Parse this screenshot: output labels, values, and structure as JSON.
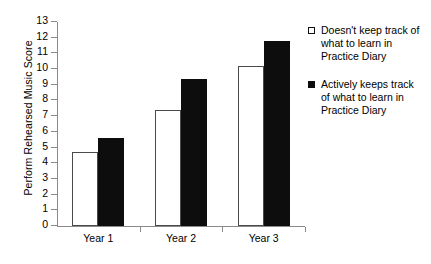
{
  "chart_data": {
    "type": "bar",
    "title": "",
    "xlabel": "",
    "ylabel": "Perform Rehearsed Music Score",
    "categories": [
      "Year 1",
      "Year 2",
      "Year 3"
    ],
    "ylim": [
      0,
      13
    ],
    "yticks": [
      0,
      1,
      2,
      3,
      4,
      5,
      6,
      7,
      8,
      9,
      10,
      11,
      12,
      13
    ],
    "ytick_labels": [
      "0",
      "1",
      "2",
      "3",
      "4",
      "5",
      "6",
      "7",
      "8",
      "9",
      "10",
      "11",
      "12",
      "13"
    ],
    "grid": false,
    "legend_position": "right",
    "series": [
      {
        "name": "Doesn't keep track of what to learn in Practice Diary",
        "style": "open",
        "fill": "#ffffff",
        "edge": "#4a4a4a",
        "values": [
          4.7,
          7.4,
          10.2
        ]
      },
      {
        "name": "Actively keeps track of what to learn in Practice Diary",
        "style": "filled",
        "fill": "#0d0d0d",
        "edge": "#0d0d0d",
        "values": [
          5.6,
          9.4,
          11.8
        ]
      }
    ]
  },
  "legend": {
    "items": [
      {
        "label": "Doesn't keep track of what to learn in Practice Diary",
        "swatch": "open-square-marker"
      },
      {
        "label": "Actively keeps track of what to learn in Practice Diary",
        "swatch": "filled-square-marker"
      }
    ]
  },
  "axes": {
    "y_title": "Perform Rehearsed Music Score"
  }
}
